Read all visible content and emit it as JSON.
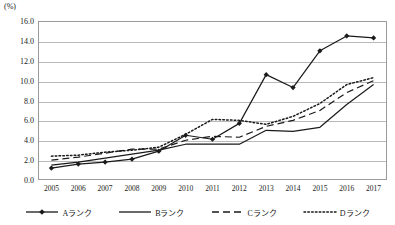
{
  "chart_data": {
    "type": "line",
    "title": "",
    "xlabel": "",
    "ylabel": "",
    "unit_label": "(%)",
    "ylim": [
      0.0,
      16.0
    ],
    "ytick_step": 2.0,
    "grid": true,
    "legend_position": "bottom",
    "categories": [
      "2005",
      "2006",
      "2007",
      "2008",
      "2009",
      "2010",
      "2011",
      "2012",
      "2013",
      "2014",
      "2015",
      "2016",
      "2017"
    ],
    "ytick_labels": [
      "0.0",
      "2.0",
      "4.0",
      "6.0",
      "8.0",
      "10.0",
      "12.0",
      "14.0",
      "16.0"
    ],
    "series": [
      {
        "name": "Aランク",
        "style": "solid-marker",
        "marker": "diamond",
        "color": "#1a1a1a",
        "values": [
          1.2,
          1.6,
          1.8,
          2.1,
          2.9,
          4.5,
          4.1,
          5.7,
          10.6,
          9.3,
          13.0,
          14.5,
          14.3
        ]
      },
      {
        "name": "Bランク",
        "style": "solid",
        "marker": "none",
        "color": "#1a1a1a",
        "values": [
          1.5,
          1.8,
          2.2,
          2.6,
          3.0,
          3.6,
          3.6,
          3.6,
          5.0,
          4.9,
          5.3,
          7.6,
          9.6
        ]
      },
      {
        "name": "Cランク",
        "style": "dashed",
        "marker": "none",
        "color": "#1a1a1a",
        "values": [
          2.0,
          2.3,
          2.7,
          3.1,
          3.1,
          4.0,
          4.4,
          4.3,
          5.4,
          6.0,
          7.0,
          8.8,
          10.0
        ]
      },
      {
        "name": "Dランク",
        "style": "dotted",
        "marker": "none",
        "color": "#1a1a1a",
        "values": [
          2.4,
          2.5,
          2.8,
          3.0,
          3.3,
          4.6,
          6.1,
          6.0,
          5.6,
          6.4,
          7.7,
          9.6,
          10.3
        ]
      }
    ]
  }
}
